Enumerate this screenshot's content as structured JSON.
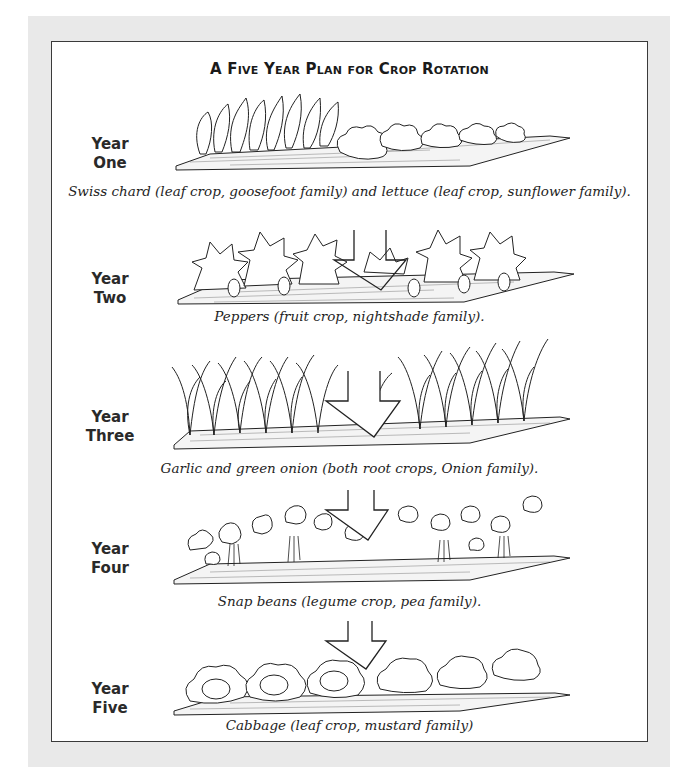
{
  "title": "A Five Year Plan for Crop Rotation",
  "years": [
    {
      "label_line1": "Year",
      "label_line2": "One",
      "caption": "Swiss chard (leaf crop, goosefoot family) and lettuce (leaf crop, sunflower family).",
      "illustration": "swiss-chard-and-lettuce-bed",
      "has_arrow": false
    },
    {
      "label_line1": "Year",
      "label_line2": "Two",
      "caption": "Peppers (fruit crop, nightshade family).",
      "illustration": "pepper-plants-bed",
      "has_arrow": true
    },
    {
      "label_line1": "Year",
      "label_line2": "Three",
      "caption": "Garlic and green onion (both root crops, Onion family).",
      "illustration": "garlic-and-onion-bed",
      "has_arrow": true
    },
    {
      "label_line1": "Year",
      "label_line2": "Four",
      "caption": "Snap beans (legume crop, pea family).",
      "illustration": "snap-bean-plants-bed",
      "has_arrow": true
    },
    {
      "label_line1": "Year",
      "label_line2": "Five",
      "caption": "Cabbage (leaf crop, mustard family)",
      "illustration": "cabbage-bed",
      "has_arrow": true
    }
  ],
  "colors": {
    "panel": "#e9e9e9",
    "frame_border": "#3a3a3a",
    "ink": "#1a1a1a"
  }
}
